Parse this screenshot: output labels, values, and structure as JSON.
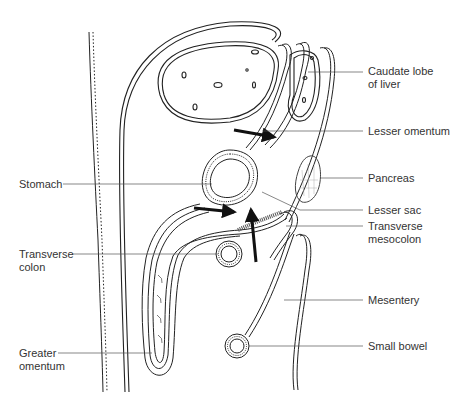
{
  "figure": {
    "type": "anatomical sagittal section",
    "stroke_color": "#222222",
    "leader_color": "#555555",
    "arrow_color": "#111111"
  },
  "labels": {
    "caudate_lobe": {
      "line1": "Caudate lobe",
      "line2": "of liver"
    },
    "lesser_omentum": {
      "line1": "Lesser omentum"
    },
    "pancreas": {
      "line1": "Pancreas"
    },
    "lesser_sac": {
      "line1": "Lesser sac"
    },
    "transverse_mesocolon": {
      "line1": "Transverse",
      "line2": "mesocolon"
    },
    "mesentery": {
      "line1": "Mesentery"
    },
    "small_bowel": {
      "line1": "Small bowel"
    },
    "stomach": {
      "line1": "Stomach"
    },
    "transverse_colon": {
      "line1": "Transverse",
      "line2": "colon"
    },
    "greater_omentum": {
      "line1": "Greater",
      "line2": "omentum"
    }
  }
}
